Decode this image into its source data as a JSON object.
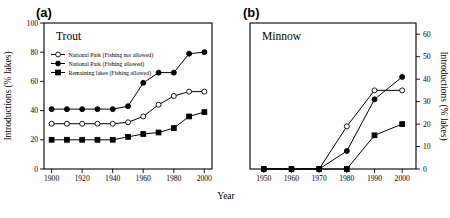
{
  "figure": {
    "xlabel": "Year",
    "ylabel_left": "Introductions (% lakes)",
    "ylabel_right": "Introductions (% lakes)"
  },
  "panel_a": {
    "tag": "(a)",
    "title": "Trout",
    "legend": [
      {
        "marker": "open-circle",
        "label": "National Park (Fishing not allowed)"
      },
      {
        "marker": "filled-circle",
        "label": "National Park (Fishing allowed)"
      },
      {
        "marker": "filled-square",
        "label": "Remaining lakes (Fishing allowed)"
      }
    ]
  },
  "panel_b": {
    "tag": "(b)",
    "title": "Minnow"
  },
  "chart_data": [
    {
      "type": "line",
      "panel": "(a)",
      "title": "Trout",
      "xlabel": "Year",
      "ylabel": "Introductions (% lakes)",
      "xlim": [
        1895,
        2005
      ],
      "ylim": [
        0,
        100
      ],
      "xticks": [
        1900,
        1920,
        1940,
        1960,
        1980,
        2000
      ],
      "yticks": [
        0,
        20,
        40,
        60,
        80,
        100
      ],
      "grid": false,
      "legend_position": "upper-left-inside",
      "x": [
        1900,
        1910,
        1920,
        1930,
        1940,
        1950,
        1960,
        1970,
        1980,
        1990,
        2000
      ],
      "series": [
        {
          "name": "National Park (Fishing not allowed)",
          "marker": "open-circle",
          "values": [
            31,
            31,
            31,
            31,
            31,
            32,
            36,
            44,
            50,
            53,
            53
          ]
        },
        {
          "name": "National Park (Fishing allowed)",
          "marker": "filled-circle",
          "values": [
            41,
            41,
            41,
            41,
            41,
            43,
            59,
            66,
            66,
            79,
            80
          ]
        },
        {
          "name": "Remaining lakes (Fishing allowed)",
          "marker": "filled-square",
          "values": [
            20,
            20,
            20,
            20,
            20,
            22,
            24,
            25,
            28,
            36,
            39
          ]
        }
      ]
    },
    {
      "type": "line",
      "panel": "(b)",
      "title": "Minnow",
      "xlabel": "Year",
      "ylabel": "Introductions (% lakes)",
      "xlim": [
        1945,
        2005
      ],
      "ylim": [
        0,
        65
      ],
      "xticks": [
        1950,
        1960,
        1970,
        1980,
        1990,
        2000
      ],
      "yticks": [
        0,
        10,
        20,
        30,
        40,
        50,
        60
      ],
      "grid": false,
      "yaxis_side": "right",
      "x": [
        1950,
        1960,
        1970,
        1980,
        1990,
        2000
      ],
      "series": [
        {
          "name": "National Park (Fishing not allowed)",
          "marker": "open-circle",
          "values": [
            0,
            0,
            0,
            19,
            35,
            35
          ]
        },
        {
          "name": "National Park (Fishing allowed)",
          "marker": "filled-circle",
          "values": [
            0,
            0,
            0,
            8,
            31,
            41
          ]
        },
        {
          "name": "Remaining lakes (Fishing allowed)",
          "marker": "filled-square",
          "values": [
            0,
            0,
            0,
            0,
            15,
            20
          ]
        }
      ]
    }
  ]
}
